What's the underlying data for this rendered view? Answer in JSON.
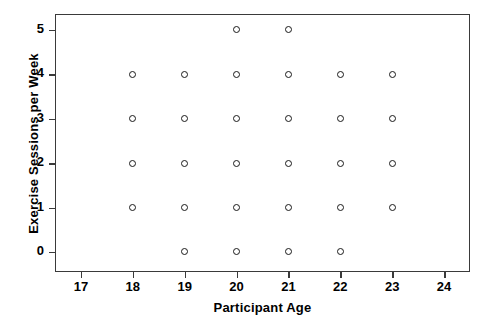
{
  "chart_data": {
    "type": "scatter",
    "title": "",
    "xlabel": "Participant Age",
    "ylabel": "Exercise Sessions per Week",
    "xlim": [
      16.5,
      24.5
    ],
    "ylim": [
      -0.45,
      5.35
    ],
    "xticks": [
      17,
      18,
      19,
      20,
      21,
      22,
      23,
      24
    ],
    "yticks": [
      0,
      1,
      2,
      3,
      4,
      5
    ],
    "xtick_labels": [
      "17",
      "18",
      "19",
      "20",
      "21",
      "22",
      "23",
      "24"
    ],
    "ytick_labels": [
      "0",
      "1",
      "2",
      "3",
      "4",
      "5"
    ],
    "grid": false,
    "legend": false,
    "marker": "open-circle",
    "marker_color": "#1a1a1a",
    "frame_color": "#3a3a3a",
    "background_color": "#ffffff",
    "x": [
      18,
      18,
      18,
      18,
      19,
      19,
      19,
      19,
      19,
      20,
      20,
      20,
      20,
      20,
      20,
      21,
      21,
      21,
      21,
      21,
      21,
      22,
      22,
      22,
      22,
      22,
      23,
      23,
      23,
      23
    ],
    "y": [
      1,
      2,
      3,
      4,
      0,
      1,
      2,
      3,
      4,
      0,
      1,
      2,
      3,
      4,
      5,
      0,
      1,
      2,
      3,
      4,
      5,
      0,
      1,
      2,
      3,
      4,
      1,
      2,
      3,
      4
    ],
    "points": [
      {
        "x": 18,
        "y": 1
      },
      {
        "x": 18,
        "y": 2
      },
      {
        "x": 18,
        "y": 3
      },
      {
        "x": 18,
        "y": 4
      },
      {
        "x": 19,
        "y": 0
      },
      {
        "x": 19,
        "y": 1
      },
      {
        "x": 19,
        "y": 2
      },
      {
        "x": 19,
        "y": 3
      },
      {
        "x": 19,
        "y": 4
      },
      {
        "x": 20,
        "y": 0
      },
      {
        "x": 20,
        "y": 1
      },
      {
        "x": 20,
        "y": 2
      },
      {
        "x": 20,
        "y": 3
      },
      {
        "x": 20,
        "y": 4
      },
      {
        "x": 20,
        "y": 5
      },
      {
        "x": 21,
        "y": 0
      },
      {
        "x": 21,
        "y": 1
      },
      {
        "x": 21,
        "y": 2
      },
      {
        "x": 21,
        "y": 3
      },
      {
        "x": 21,
        "y": 4
      },
      {
        "x": 21,
        "y": 5
      },
      {
        "x": 22,
        "y": 0
      },
      {
        "x": 22,
        "y": 1
      },
      {
        "x": 22,
        "y": 2
      },
      {
        "x": 22,
        "y": 3
      },
      {
        "x": 22,
        "y": 4
      },
      {
        "x": 23,
        "y": 1
      },
      {
        "x": 23,
        "y": 2
      },
      {
        "x": 23,
        "y": 3
      },
      {
        "x": 23,
        "y": 4
      }
    ]
  }
}
